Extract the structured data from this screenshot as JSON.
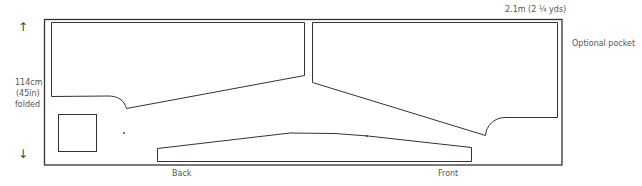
{
  "dimensions": {
    "width_label": "2.1m (2 ¼ yds)",
    "height_label_line1": "114cm",
    "height_label_line2": "(45in)",
    "height_label_line3": "folded"
  },
  "labels": {
    "back": "Back",
    "front": "Front",
    "optional_pocket": "Optional pocket"
  },
  "icons": {
    "arrow_up": "↑",
    "arrow_down": "↓"
  }
}
